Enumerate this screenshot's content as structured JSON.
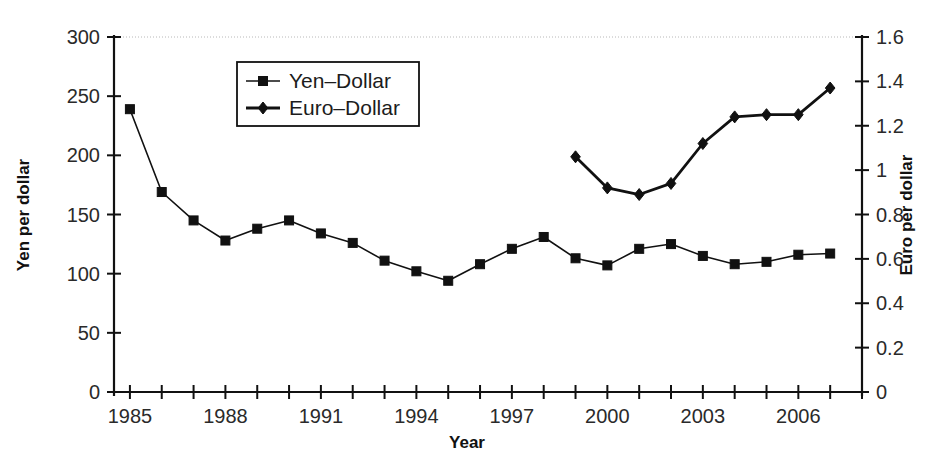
{
  "chart_data": {
    "type": "line",
    "title": "",
    "xlabel": "Year",
    "ylabel_left": "Yen per dollar",
    "ylabel_right": "Euro per dollar",
    "grid": false,
    "legend_position": "top-left-inside",
    "xlim": [
      1984.5,
      2008.0
    ],
    "xticks_all": [
      1985,
      1986,
      1987,
      1988,
      1989,
      1990,
      1991,
      1992,
      1993,
      1994,
      1995,
      1996,
      1997,
      1998,
      1999,
      2000,
      2001,
      2002,
      2003,
      2004,
      2005,
      2006,
      2007,
      2008
    ],
    "xticklabels": [
      "1985",
      "1988",
      "1991",
      "1994",
      "1997",
      "2000",
      "2003",
      "2006"
    ],
    "xticklabel_values": [
      1985,
      1988,
      1991,
      1994,
      1997,
      2000,
      2003,
      2006
    ],
    "ylim_left": [
      0,
      300
    ],
    "yticks_left": [
      0,
      50,
      100,
      150,
      200,
      250,
      300
    ],
    "yticklabels_left": [
      "0",
      "50",
      "100",
      "150",
      "200",
      "250",
      "300"
    ],
    "ylim_right": [
      0,
      1.6
    ],
    "yticks_right": [
      0,
      0.2,
      0.4,
      0.6,
      0.8,
      1.0,
      1.2,
      1.4,
      1.6
    ],
    "yticklabels_right": [
      "0",
      "0.2",
      "0.4",
      "0.6",
      "0.8",
      "1",
      "1.2",
      "1.4",
      "1.6"
    ],
    "series": [
      {
        "name": "Yen–Dollar",
        "axis": "left",
        "marker": "square",
        "color": "#111111",
        "x": [
          1985,
          1986,
          1987,
          1988,
          1989,
          1990,
          1991,
          1992,
          1993,
          1994,
          1995,
          1996,
          1997,
          1998,
          1999,
          2000,
          2001,
          2002,
          2003,
          2004,
          2005,
          2006,
          2007
        ],
        "values": [
          239,
          169,
          145,
          128,
          138,
          145,
          134,
          126,
          111,
          102,
          94,
          108,
          121,
          131,
          113,
          107,
          121,
          125,
          115,
          108,
          110,
          116,
          117
        ]
      },
      {
        "name": "Euro–Dollar",
        "axis": "right",
        "marker": "diamond",
        "color": "#111111",
        "x": [
          1999,
          2000,
          2001,
          2002,
          2003,
          2004,
          2005,
          2006,
          2007
        ],
        "values": [
          1.06,
          0.92,
          0.89,
          0.94,
          1.12,
          1.24,
          1.25,
          1.25,
          1.37
        ]
      }
    ],
    "legend": [
      {
        "label": "Yen–Dollar",
        "marker": "square"
      },
      {
        "label": "Euro–Dollar",
        "marker": "diamond"
      }
    ]
  }
}
